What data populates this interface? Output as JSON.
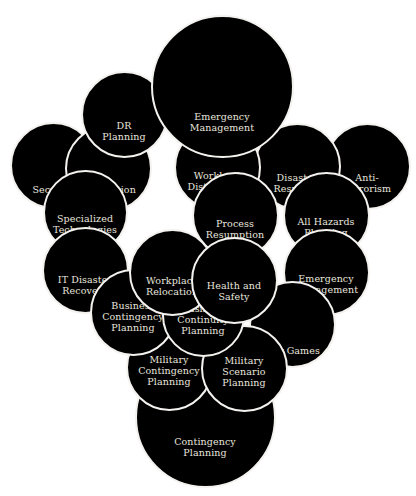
{
  "diagram": {
    "type": "overlapping-bubble-cluster",
    "background": "#ffffff",
    "bubble_fill": "#000000",
    "bubble_border": "#f4f2ee",
    "label_color": "#e9e6df",
    "nodes": [
      {
        "id": "security",
        "label": "Security",
        "cx": 53,
        "cy": 165,
        "r": 41,
        "label_dy": 22
      },
      {
        "id": "replication",
        "label": "Replication",
        "cx": 108,
        "cy": 168,
        "r": 41,
        "label_dy": 19
      },
      {
        "id": "dr-planning",
        "label": "DR\nPlanning",
        "cx": 124,
        "cy": 114,
        "r": 41,
        "label_dy": 15
      },
      {
        "id": "specialized-technologies",
        "label": "Specialized\nTechnologies",
        "cx": 85,
        "cy": 212,
        "r": 40,
        "label_dy": 10
      },
      {
        "id": "it-disaster-recovery",
        "label": "IT Disaster\nRecovery",
        "cx": 85,
        "cy": 270,
        "r": 41,
        "label_dy": 13
      },
      {
        "id": "anti-terrorism",
        "label": "Anti-\nTerrorism",
        "cx": 367,
        "cy": 166,
        "r": 41,
        "label_dy": 15
      },
      {
        "id": "disaster-response",
        "label": "Disaster\nResponse",
        "cx": 297,
        "cy": 166,
        "r": 41,
        "label_dy": 15
      },
      {
        "id": "all-hazards-planning",
        "label": "All Hazards\nPlanning",
        "cx": 326,
        "cy": 215,
        "r": 41,
        "label_dy": 10
      },
      {
        "id": "emergency-management-right",
        "label": "Emergency\nManagement",
        "cx": 326,
        "cy": 272,
        "r": 41,
        "label_dy": 10
      },
      {
        "id": "war-games",
        "label": "War Games",
        "cx": 292,
        "cy": 324,
        "r": 41,
        "label_dy": 24
      },
      {
        "id": "workload-distribution",
        "label": "Workload\nDistribution",
        "cx": 217,
        "cy": 167,
        "r": 41,
        "label_dy": 12
      },
      {
        "id": "process-resumption",
        "label": "Process\nResumption",
        "cx": 235,
        "cy": 215,
        "r": 41,
        "label_dy": 12
      },
      {
        "id": "emergency-management-top",
        "label": "Emergency\nManagement",
        "cx": 222,
        "cy": 86,
        "r": 69,
        "label_dy": 34
      },
      {
        "id": "contingency-planning",
        "label": "Contingency\nPlanning",
        "cx": 205,
        "cy": 417,
        "r": 68,
        "label_dy": 28
      },
      {
        "id": "military-contingency-planning",
        "label": "Military\nContingency\nPlanning",
        "cx": 169,
        "cy": 367,
        "r": 41,
        "label_dy": 1
      },
      {
        "id": "military-scenario-planning",
        "label": "Military\nScenario\nPlanning",
        "cx": 244,
        "cy": 368,
        "r": 41,
        "label_dy": 1
      },
      {
        "id": "business-contingency-planning",
        "label": "Business\nContingency\nPlanning",
        "cx": 133,
        "cy": 312,
        "r": 41,
        "label_dy": 2
      },
      {
        "id": "business-continuity-planning",
        "label": "Business\nContinuity\nPlanning",
        "cx": 203,
        "cy": 315,
        "r": 39,
        "label_dy": 2
      },
      {
        "id": "workplace-relocation",
        "label": "Workplace\nRelocation",
        "cx": 172,
        "cy": 272,
        "r": 41,
        "label_dy": 12
      },
      {
        "id": "health-and-safety",
        "label": "Health and\nSafety",
        "cx": 234,
        "cy": 280,
        "r": 41,
        "label_dy": 9
      }
    ]
  }
}
